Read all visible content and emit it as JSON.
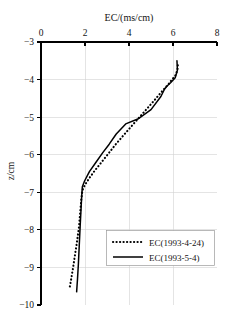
{
  "chart_data": {
    "type": "line",
    "title": "EC/(ms/cm)",
    "title_position": "top",
    "xlabel": "EC/(ms/cm)",
    "ylabel": "z/cm",
    "xlim": [
      0,
      8
    ],
    "ylim": [
      -10,
      -3
    ],
    "xticks": [
      0,
      2,
      4,
      6,
      8
    ],
    "yticks": [
      -3,
      -4,
      -5,
      -6,
      -7,
      -8,
      -9,
      -10
    ],
    "xtick_labels": [
      "0",
      "2",
      "4",
      "6",
      "8"
    ],
    "ytick_labels": [
      "-3",
      "-4",
      "-5",
      "-6",
      "-7",
      "-8",
      "-9",
      "-10"
    ],
    "x_axis_position": "top",
    "grid": true,
    "grid_color": "#d2d2d2",
    "legend_position": "lower-right",
    "series": [
      {
        "name": "EC(1993-4-24)",
        "style": "dotted",
        "color": "#000000",
        "x": [
          6.22,
          6.2,
          6.1,
          5.95,
          5.8,
          5.55,
          5.2,
          4.75,
          4.25,
          3.8,
          3.4,
          3.05,
          2.75,
          2.45,
          2.2,
          2.0,
          1.88,
          1.83,
          1.78,
          1.72,
          1.64,
          1.55,
          1.46,
          1.36,
          1.3
        ],
        "y": [
          -3.62,
          -3.75,
          -3.9,
          -4.0,
          -4.12,
          -4.28,
          -4.52,
          -4.82,
          -5.15,
          -5.45,
          -5.72,
          -5.98,
          -6.2,
          -6.42,
          -6.62,
          -6.8,
          -6.95,
          -7.2,
          -7.55,
          -7.95,
          -8.3,
          -8.65,
          -9.0,
          -9.35,
          -9.55
        ]
      },
      {
        "name": "EC(1993-5-4)",
        "style": "solid",
        "color": "#000000",
        "x": [
          6.18,
          6.2,
          6.1,
          5.9,
          5.72,
          5.62,
          5.45,
          5.0,
          4.4,
          3.85,
          3.42,
          3.1,
          2.8,
          2.5,
          2.2,
          1.98,
          1.88,
          1.85,
          1.82,
          1.78,
          1.74,
          1.7,
          1.66,
          1.62
        ],
        "y": [
          -3.5,
          -3.75,
          -3.95,
          -4.08,
          -4.18,
          -4.25,
          -4.45,
          -4.8,
          -5.05,
          -5.18,
          -5.45,
          -5.72,
          -5.95,
          -6.2,
          -6.45,
          -6.7,
          -6.85,
          -7.1,
          -7.45,
          -7.9,
          -8.4,
          -8.9,
          -9.3,
          -9.65
        ]
      }
    ],
    "legend_entries": [
      {
        "label": "EC(1993-4-24)",
        "style": "dotted"
      },
      {
        "label": "EC(1993-5-4)",
        "style": "solid"
      }
    ]
  }
}
